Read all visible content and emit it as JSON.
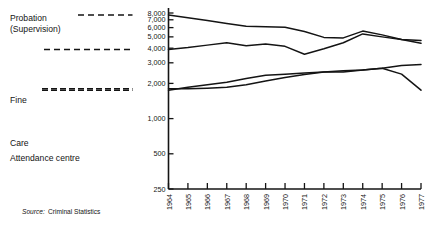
{
  "chart_data": {
    "type": "line",
    "title": "",
    "subtitle": "",
    "xlabel": "",
    "ylabel": "",
    "yscale": "log",
    "ylim": [
      250,
      8000
    ],
    "grid": false,
    "legend_position": "left-inline",
    "x": [
      1964,
      1965,
      1966,
      1967,
      1968,
      1969,
      1970,
      1971,
      1972,
      1973,
      1974,
      1975,
      1976,
      1977
    ],
    "categories": [
      "1964",
      "1965",
      "1966",
      "1967",
      "1968",
      "1969",
      "1970",
      "1971",
      "1972",
      "1973",
      "1974",
      "1975",
      "1976",
      "1977"
    ],
    "ytick_labels": [
      "8,000",
      "7,000",
      "6,000",
      "5,000",
      "4,000",
      "3,000",
      "2,000",
      "1,000",
      "500",
      "250"
    ],
    "ytick_values": [
      8000,
      7000,
      6000,
      5000,
      4000,
      3000,
      2000,
      1000,
      500,
      250
    ],
    "series": [
      {
        "name": "Probation (Supervision)",
        "legend_label_line1": "Probation",
        "legend_label_line2": "(Supervision)",
        "values": [
          7700,
          7300,
          6900,
          6500,
          6150,
          6100,
          6050,
          5550,
          4950,
          4900,
          5600,
          5200,
          4750,
          4400
        ]
      },
      {
        "name": "Fine",
        "legend_label_line1": "Fine",
        "legend_label_line2": "",
        "values": [
          3900,
          4050,
          4250,
          4450,
          4200,
          4350,
          4150,
          3550,
          3950,
          4450,
          5300,
          5000,
          4750,
          4650
        ]
      },
      {
        "name": "Care",
        "legend_label_line1": "Care",
        "legend_label_line2": "",
        "values": [
          1750,
          1850,
          1950,
          2050,
          2200,
          2350,
          2400,
          2450,
          2500,
          2500,
          2600,
          2700,
          2850,
          2900
        ]
      },
      {
        "name": "Attendance centre",
        "legend_label_line1": "Attendance centre",
        "legend_label_line2": "",
        "values": [
          1800,
          1800,
          1820,
          1850,
          1950,
          2100,
          2250,
          2380,
          2500,
          2560,
          2600,
          2700,
          2400,
          1750
        ]
      }
    ],
    "annotations": []
  },
  "legend": {
    "probation_line1": "Probation",
    "probation_line2": "(Supervision)",
    "fine": "Fine",
    "care": "Care",
    "attendance": "Attendance centre"
  },
  "source": {
    "prefix": "Source:",
    "text": "Criminal Statistics"
  }
}
